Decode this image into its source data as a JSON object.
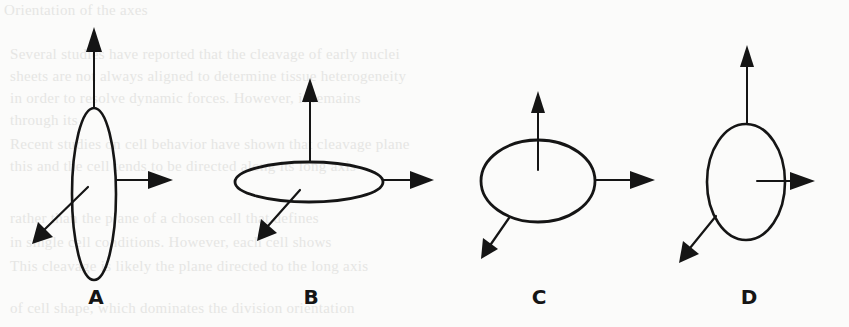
{
  "figure": {
    "background_text": [
      "Orientation of the axes",
      "Several studies have reported that the cleavage of early nuclei",
      "sheets are not always aligned to determine tissue heterogeneity",
      "in order to resolve dynamic forces. However, it remains",
      "through its",
      "Recent studies on cell behavior have shown that cleavage plane",
      "this and the cell tends to be directed along its long axis",
      "rather than the plane of a chosen cell that defines",
      "in single cell conditions. However, each cell shows",
      "This cleavage is likely the plane directed to the long axis",
      "of cell shape, which dominates the division orientation"
    ],
    "panels": [
      {
        "id": "A",
        "label": "A",
        "shape": "tall-ellipse"
      },
      {
        "id": "B",
        "label": "B",
        "shape": "flat-ellipse"
      },
      {
        "id": "C",
        "label": "C",
        "shape": "near-circle"
      },
      {
        "id": "D",
        "label": "D",
        "shape": "upright-ellipse"
      }
    ],
    "colors": {
      "stroke": "#151515",
      "paper": "#fbfbfa",
      "ghost_text": "#e6e6e4"
    }
  }
}
